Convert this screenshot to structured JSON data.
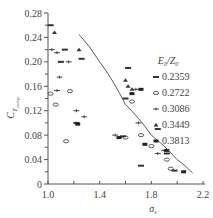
{
  "chart_data": {
    "type": "scatter",
    "title": "",
    "xlabel": "σ_s",
    "ylabel": "C_T_comp",
    "xlim": [
      1.0,
      2.2
    ],
    "ylim": [
      0,
      0.28
    ],
    "x_ticks": [
      "1.0",
      "1.4",
      "1.8",
      "2.2"
    ],
    "y_ticks": [
      "0",
      "0.04",
      "0.08",
      "0.12",
      "0.16",
      "0.20",
      "0.24",
      "0.28"
    ],
    "grid": false,
    "legend": {
      "title": "E0/Z0",
      "position": "upper-right",
      "entries": [
        "0.2359",
        "0.2722",
        "0.3086",
        "0.3449",
        "0.3813"
      ]
    },
    "series": [
      {
        "name": "0.2359",
        "marker": "filled-dash",
        "points": [
          [
            1.02,
            0.26
          ],
          [
            1.13,
            0.22
          ],
          [
            1.26,
            0.205
          ],
          [
            1.1,
            0.2
          ],
          [
            1.22,
            0.1
          ],
          [
            1.62,
            0.19
          ],
          [
            1.58,
            0.078
          ],
          [
            1.92,
            0.05
          ],
          [
            1.85,
            0.09
          ],
          [
            1.72,
            0.03
          ],
          [
            1.98,
            0.022
          ],
          [
            1.6,
            0.14
          ]
        ]
      },
      {
        "name": "0.2722",
        "marker": "circle",
        "points": [
          [
            1.02,
            0.148
          ],
          [
            1.17,
            0.152
          ],
          [
            1.06,
            0.13
          ],
          [
            1.14,
            0.07
          ],
          [
            1.6,
            0.076
          ],
          [
            1.8,
            0.062
          ],
          [
            1.92,
            0.04
          ],
          [
            1.95,
            0.025
          ],
          [
            1.65,
            0.135
          ],
          [
            1.72,
            0.08
          ]
        ]
      },
      {
        "name": "0.3086",
        "marker": "plus",
        "points": [
          [
            1.03,
            0.22
          ],
          [
            1.07,
            0.215
          ],
          [
            1.09,
            0.175
          ],
          [
            1.07,
            0.153
          ],
          [
            1.22,
            0.12
          ],
          [
            1.28,
            0.11
          ],
          [
            1.16,
            0.2
          ],
          [
            1.52,
            0.08
          ],
          [
            1.7,
            0.1
          ],
          [
            1.85,
            0.05
          ],
          [
            1.9,
            0.055
          ],
          [
            1.68,
            0.155
          ]
        ]
      },
      {
        "name": "0.3449",
        "marker": "triangle",
        "points": [
          [
            1.05,
            0.248
          ],
          [
            1.24,
            0.22
          ],
          [
            1.6,
            0.17
          ],
          [
            1.62,
            0.16
          ],
          [
            1.65,
            0.155
          ]
        ]
      },
      {
        "name": "0.3813",
        "marker": "square",
        "points": [
          [
            1.23,
            0.098
          ],
          [
            1.55,
            0.076
          ],
          [
            1.65,
            0.148
          ],
          [
            1.75,
            0.065
          ],
          [
            1.92,
            0.055
          ],
          [
            2.05,
            0.02
          ],
          [
            1.72,
            0.155
          ]
        ]
      }
    ],
    "fit_curve": {
      "x": [
        1.24,
        1.4,
        1.6,
        1.8,
        2.0,
        2.12
      ],
      "y": [
        0.245,
        0.2,
        0.13,
        0.08,
        0.04,
        0.018
      ]
    }
  }
}
